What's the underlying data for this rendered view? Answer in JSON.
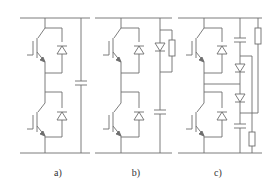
{
  "figure": {
    "type": "circuit-diagram",
    "line_color": "#6e6e6e",
    "background": "#ffffff",
    "panels": [
      {
        "id": "a",
        "label": "a)",
        "components": [
          "IGBT (upper)",
          "IGBT (lower)",
          "anti-parallel diode (upper)",
          "anti-parallel diode (lower)",
          "DC-link capacitor across rails"
        ]
      },
      {
        "id": "b",
        "label": "b)",
        "components": [
          "IGBT (upper)",
          "IGBT (lower)",
          "anti-parallel diode (upper)",
          "anti-parallel diode (lower)",
          "snubber diode with parallel resistor",
          "snubber capacitor"
        ]
      },
      {
        "id": "c",
        "label": "c)",
        "components": [
          "IGBT (upper)",
          "IGBT (lower)",
          "anti-parallel diode (upper)",
          "anti-parallel diode (lower)",
          "snubber capacitor (upper)",
          "snubber diode (upper)",
          "snubber diode (lower)",
          "snubber capacitor (lower)",
          "discharge resistor (upper)",
          "discharge resistor (lower)"
        ]
      }
    ]
  }
}
